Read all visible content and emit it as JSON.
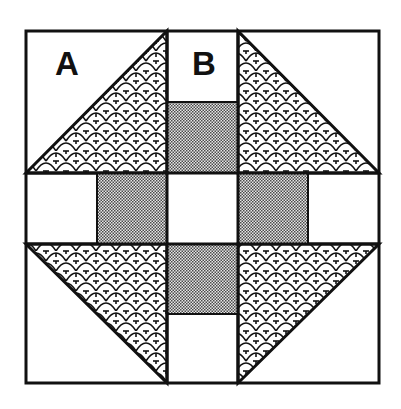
{
  "diagram": {
    "type": "quilt-block",
    "labels": {
      "a": "A",
      "b": "B"
    },
    "colors": {
      "outline": "#111111",
      "background": "#ffffff",
      "checker_dark": "#555555",
      "checker_light": "#e6e6e6",
      "scale_line": "#111111"
    },
    "pieces": [
      {
        "id": "corner-top-left",
        "shape": "half-square-triangle",
        "label": "A",
        "fill_top": "white",
        "fill_bottom": "scale-pattern"
      },
      {
        "id": "center-top",
        "shape": "rectangle-pair",
        "label": "B",
        "top": "white",
        "bottom": "checker-gray"
      },
      {
        "id": "corner-top-right",
        "shape": "half-square-triangle",
        "fill_top": "white",
        "fill_bottom": "scale-pattern"
      },
      {
        "id": "middle-left",
        "shape": "rectangle-pair",
        "left": "white",
        "right": "checker-gray"
      },
      {
        "id": "center",
        "shape": "square",
        "fill": "white"
      },
      {
        "id": "middle-right",
        "shape": "rectangle-pair",
        "left": "checker-gray",
        "right": "white"
      },
      {
        "id": "corner-bottom-left",
        "shape": "half-square-triangle",
        "fill_top": "scale-pattern",
        "fill_bottom": "white"
      },
      {
        "id": "center-bottom",
        "shape": "rectangle-pair",
        "top": "checker-gray",
        "bottom": "white"
      },
      {
        "id": "corner-bottom-right",
        "shape": "half-square-triangle",
        "fill_top": "scale-pattern",
        "fill_bottom": "white"
      }
    ]
  }
}
